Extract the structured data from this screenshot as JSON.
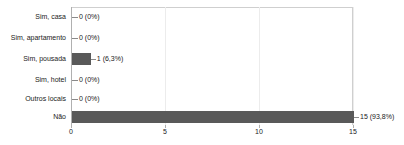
{
  "chart_data": {
    "type": "bar",
    "orientation": "horizontal",
    "title": "",
    "xlabel": "",
    "ylabel": "",
    "xlim": [
      0,
      15
    ],
    "xticks": [
      "0",
      "5",
      "10",
      "15"
    ],
    "xtick_values": [
      0,
      5,
      10,
      15
    ],
    "grid": true,
    "grid_axis": "x",
    "legend": false,
    "categories": [
      "Sim, casa",
      "Sim, apartamento",
      "Sim, pousada",
      "Sim, hotel",
      "Outros locais",
      "Não"
    ],
    "values": [
      0,
      0,
      1,
      0,
      0,
      15
    ],
    "percents": [
      "0%",
      "0%",
      "6,3%",
      "0%",
      "0%",
      "93,8%"
    ],
    "data_labels": [
      "0 (0%)",
      "0 (0%)",
      "1 (6,3%)",
      "0 (0%)",
      "0 (0%)",
      "15 (93,8%)"
    ],
    "bar_color": "#595959",
    "grid_color": "#ececec",
    "axis_color": "#b0b0b0",
    "background": "#ffffff"
  },
  "rows": [
    {
      "label": "Sim, casa",
      "value": 0,
      "data_label": "0 (0%)"
    },
    {
      "label": "Sim, apartamento",
      "value": 0,
      "data_label": "0 (0%)"
    },
    {
      "label": "Sim, pousada",
      "value": 1,
      "data_label": "1 (6,3%)"
    },
    {
      "label": "Sim, hotel",
      "value": 0,
      "data_label": "0 (0%)"
    },
    {
      "label": "Outros locais",
      "value": 0,
      "data_label": "0 (0%)"
    },
    {
      "label": "Não",
      "value": 15,
      "data_label": "15 (93,8%)"
    }
  ],
  "axis": {
    "ticks": [
      {
        "label": "0",
        "value": 0
      },
      {
        "label": "5",
        "value": 5
      },
      {
        "label": "10",
        "value": 10
      },
      {
        "label": "15",
        "value": 15
      }
    ]
  }
}
